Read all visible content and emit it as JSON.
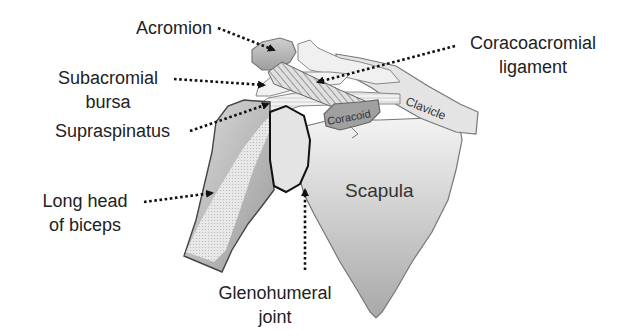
{
  "figure": {
    "colors": {
      "background": "#ffffff",
      "bone_light": "#e6e6e6",
      "bone_mid": "#c4c4c4",
      "bone_dark": "#8c8c8c",
      "outline": "#555555",
      "text": "#222222"
    }
  },
  "labels": {
    "acromion": "Acromion",
    "subacromial_bursa_line1": "Subacromial",
    "subacromial_bursa_line2": "bursa",
    "supraspinatus": "Supraspinatus",
    "long_head_biceps_line1": "Long head",
    "long_head_biceps_line2": "of biceps",
    "coracoacromial_line1": "Coracoacromial",
    "coracoacromial_line2": "ligament",
    "glenohumeral_line1": "Glenohumeral",
    "glenohumeral_line2": "joint",
    "scapula": "Scapula",
    "coracoid": "Coracoid",
    "clavicle": "Clavicle"
  }
}
